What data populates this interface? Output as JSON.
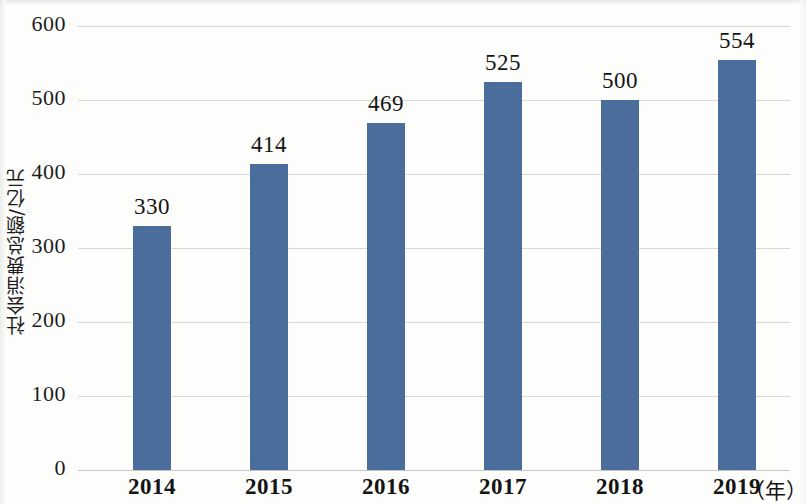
{
  "chart_data": {
    "type": "bar",
    "title": "",
    "subtitle": "",
    "xlabel": "（年）",
    "ylabel": "社会消费总额/亿元",
    "categories": [
      "2014",
      "2015",
      "2016",
      "2017",
      "2018",
      "2019"
    ],
    "values": [
      330,
      414,
      469,
      525,
      500,
      554
    ],
    "data_labels": [
      "330",
      "414",
      "469",
      "525",
      "500",
      "554"
    ],
    "ylim": [
      0,
      600
    ],
    "y_ticks": [
      0,
      100,
      200,
      300,
      400,
      500,
      600
    ],
    "y_tick_labels": [
      "0",
      "100",
      "200",
      "300",
      "400",
      "500",
      "600"
    ],
    "grid": "horizontal",
    "legend": "none",
    "series": [
      {
        "name": "社会消费总额",
        "values": [
          330,
          414,
          469,
          525,
          500,
          554
        ],
        "color": "#4a6d9b"
      }
    ],
    "colors": {
      "bar": "#4a6d9b",
      "gridline": "#d7d7d7",
      "axis": "#c6c6c6",
      "text": "#141414",
      "background": "#fdfdfc"
    }
  }
}
